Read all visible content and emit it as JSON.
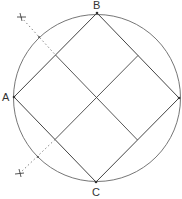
{
  "diagram": {
    "labels": {
      "A": "A",
      "B": "B",
      "C": "C"
    },
    "colors": {
      "line": "#444444",
      "circle": "#666666",
      "dotted": "#777777"
    }
  }
}
